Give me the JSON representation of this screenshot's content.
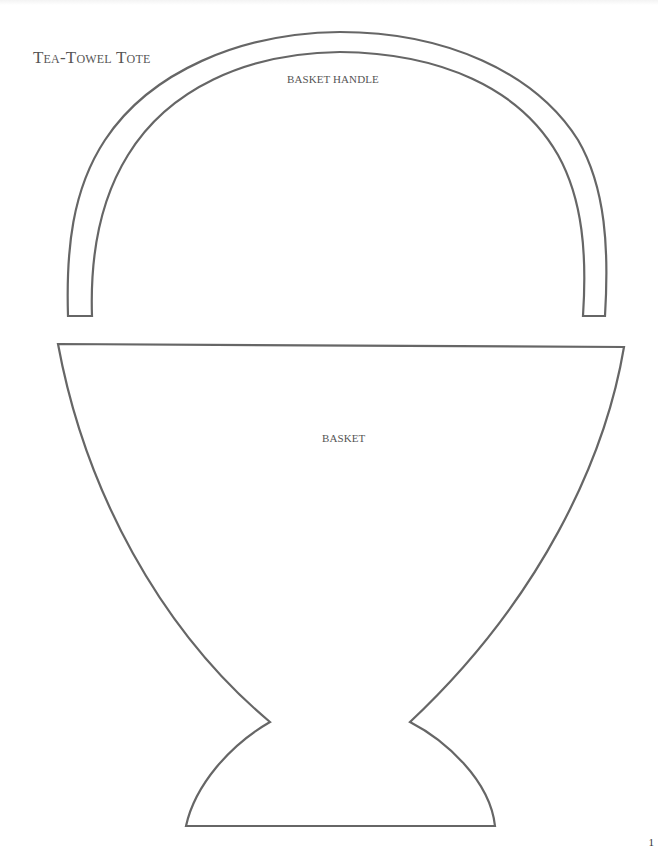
{
  "page": {
    "title": "Tea-Towel Tote",
    "page_number": "1"
  },
  "pattern": {
    "pieces": [
      {
        "id": "handle",
        "label": "BASKET HANDLE"
      },
      {
        "id": "basket",
        "label": "BASKET"
      }
    ],
    "stroke_color": "#666666",
    "background_color": "#ffffff"
  }
}
